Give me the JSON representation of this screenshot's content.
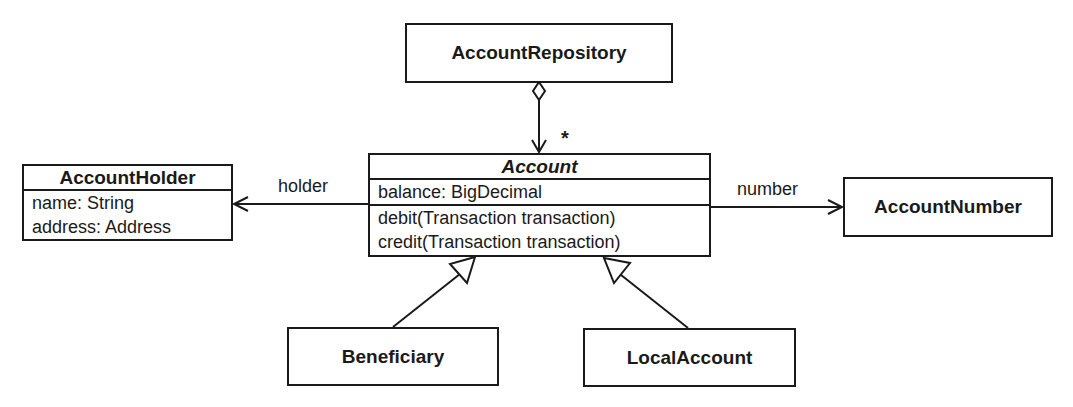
{
  "diagram": {
    "type": "UML class diagram",
    "classes": {
      "account_repository": {
        "name": "AccountRepository"
      },
      "account": {
        "name": "Account",
        "abstract": true,
        "attributes": [
          "balance: BigDecimal"
        ],
        "operations": [
          "debit(Transaction transaction)",
          "credit(Transaction transaction)"
        ]
      },
      "account_holder": {
        "name": "AccountHolder",
        "attributes": [
          "name: String",
          "address: Address"
        ]
      },
      "account_number": {
        "name": "AccountNumber"
      },
      "beneficiary": {
        "name": "Beneficiary"
      },
      "local_account": {
        "name": "LocalAccount"
      }
    },
    "relations": {
      "repository_account": {
        "type": "aggregation",
        "from": "AccountRepository",
        "to": "Account",
        "multiplicity": "*"
      },
      "holder": {
        "type": "association",
        "from": "Account",
        "to": "AccountHolder",
        "label": "holder"
      },
      "number": {
        "type": "association",
        "from": "Account",
        "to": "AccountNumber",
        "label": "number"
      },
      "beneficiary_gen": {
        "type": "generalization",
        "from": "Beneficiary",
        "to": "Account"
      },
      "local_gen": {
        "type": "generalization",
        "from": "LocalAccount",
        "to": "Account"
      }
    },
    "colors": {
      "line": "#1a1a1a",
      "background": "#ffffff"
    }
  }
}
